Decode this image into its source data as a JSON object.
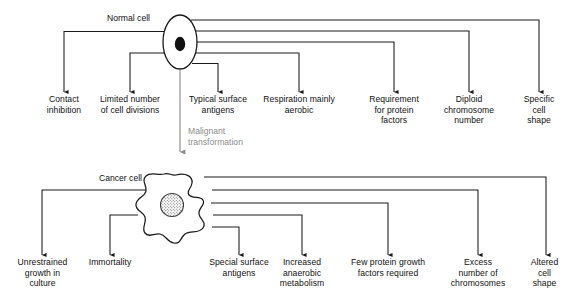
{
  "diagram": {
    "stroke_color": "#1a1a1a",
    "transform_color": "#8d8d8d",
    "background_color": "#ffffff"
  },
  "top_section": {
    "cell_label": "Normal cell",
    "cell_icon": "oval-cell-with-nucleus",
    "properties": [
      {
        "id": "contact-inhibition",
        "text": "Contact\ninhibition"
      },
      {
        "id": "limited-divisions",
        "text": "Limited number\nof cell divisions"
      },
      {
        "id": "typical-antigens",
        "text": "Typical surface\nantigens"
      },
      {
        "id": "respiration-aerobic",
        "text": "Respiration mainly\naerobic"
      },
      {
        "id": "protein-factors",
        "text": "Requirement\nfor protein\nfactors"
      },
      {
        "id": "diploid-chromosomes",
        "text": "Diploid\nchromosome\nnumber"
      },
      {
        "id": "specific-shape",
        "text": "Specific\ncell\nshape"
      }
    ]
  },
  "transition": {
    "label": "Malignant\ntransformation",
    "icon": "down-arrow-icon"
  },
  "bottom_section": {
    "cell_label": "Cancer cell",
    "cell_icon": "irregular-cell-with-stippled-nucleus",
    "properties": [
      {
        "id": "unrestrained-growth",
        "text": "Unrestrained\ngrowth in\nculture"
      },
      {
        "id": "immortality",
        "text": "Immortality"
      },
      {
        "id": "special-antigens",
        "text": "Special surface\nantigens"
      },
      {
        "id": "anaerobic-metabolism",
        "text": "Increased\nanaerobic\nmetabolism"
      },
      {
        "id": "few-growth-factors",
        "text": "Few protein growth\nfactors required"
      },
      {
        "id": "excess-chromosomes",
        "text": "Excess\nnumber of\nchromosomes"
      },
      {
        "id": "altered-shape",
        "text": "Altered\ncell\nshape"
      }
    ]
  }
}
